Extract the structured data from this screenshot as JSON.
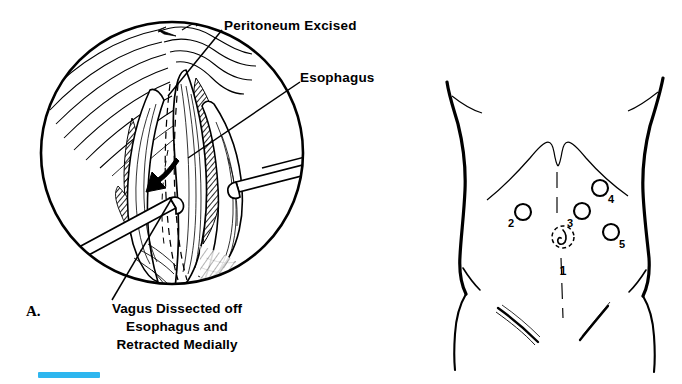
{
  "figure": {
    "background_color": "#ffffff",
    "ink_color": "#000000",
    "panels": [
      {
        "letter": "A.",
        "kind": "operative-field-circular-inset",
        "description": "Circular laparoscopic view of the esophageal hiatus with peritoneum excised and vagus nerve retracted",
        "callout_labels": [
          {
            "id": "peritoneum",
            "text": "Peritoneum Excised"
          },
          {
            "id": "esophagus",
            "text": "Esophagus"
          }
        ],
        "caption_lines": [
          "Vagus Dissected off",
          "Esophagus and",
          "Retracted Medially"
        ]
      },
      {
        "letter": "B.",
        "kind": "torso-port-placement-diagram",
        "description": "Anterior abdominal wall showing laparoscopic trocar port sites",
        "ports": [
          {
            "number": "1",
            "site": "umbilical",
            "cx": 133,
            "cy": 237,
            "r": 11,
            "style": "dashed-umbilicus",
            "label_dx": 0,
            "label_dy": 34
          },
          {
            "number": "2",
            "site": "left-lateral",
            "cx": 93,
            "cy": 212,
            "r": 8,
            "style": "solid",
            "label_dx": -10,
            "label_dy": 11
          },
          {
            "number": "3",
            "site": "right-midline",
            "cx": 152,
            "cy": 211,
            "r": 8,
            "style": "solid",
            "label_dx": -11,
            "label_dy": 12
          },
          {
            "number": "4",
            "site": "right-subcostal",
            "cx": 170,
            "cy": 188,
            "r": 8,
            "style": "solid",
            "label_dx": 8,
            "label_dy": 12
          },
          {
            "number": "5",
            "site": "right-lateral",
            "cx": 181,
            "cy": 232,
            "r": 8,
            "style": "solid",
            "label_dx": 8,
            "label_dy": 13
          }
        ]
      }
    ],
    "scale_bar": {
      "color": "#2eb6ef",
      "visible": true
    }
  }
}
